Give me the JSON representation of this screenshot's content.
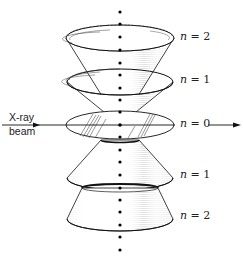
{
  "diagram": {
    "type": "x-ray diffraction cones",
    "beam_label_line1": "X-ray",
    "beam_label_line2": "beam",
    "orders": [
      {
        "id": "top-n2",
        "n_symbol": "n",
        "eq": " = ",
        "value": "2"
      },
      {
        "id": "top-n1",
        "n_symbol": "n",
        "eq": " = ",
        "value": "1"
      },
      {
        "id": "n0",
        "n_symbol": "n",
        "eq": " = ",
        "value": "0"
      },
      {
        "id": "bottom-n1",
        "n_symbol": "n",
        "eq": " = ",
        "value": "1"
      },
      {
        "id": "bottom-n2",
        "n_symbol": "n",
        "eq": " = ",
        "value": "2"
      }
    ],
    "colors": {
      "ink": "#111111",
      "background": "#ffffff"
    }
  }
}
